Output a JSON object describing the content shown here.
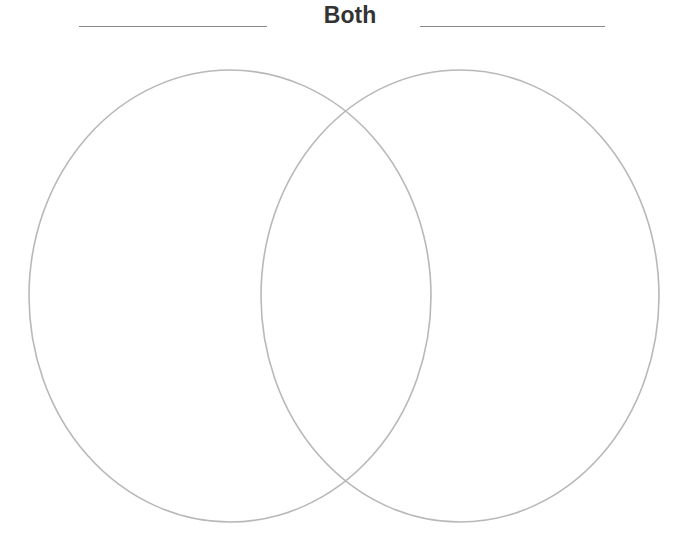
{
  "header": {
    "left_label_line": "",
    "center_label": "Both",
    "right_label_line": ""
  },
  "diagram": {
    "type": "venn",
    "stroke_color": "#b8b8b8",
    "circles": [
      {
        "name": "left",
        "cx": 230,
        "cy": 296,
        "rx": 201,
        "ry": 226
      },
      {
        "name": "right",
        "cx": 460,
        "cy": 296,
        "rx": 199,
        "ry": 226
      }
    ]
  }
}
